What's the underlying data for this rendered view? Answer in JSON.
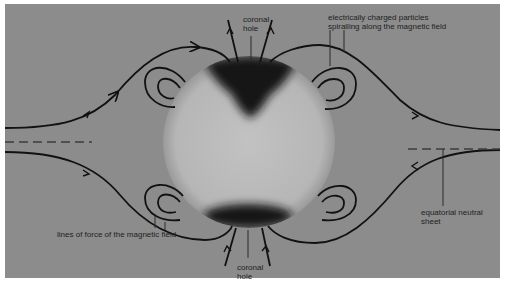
{
  "figure": {
    "background_color": "#8c8c8c",
    "sun_color": "#b9b9b9",
    "hole_color": "#141414",
    "line_color": "#111111"
  },
  "labels": {
    "coronal_hole_top": {
      "line1": "coronal",
      "line2": "hole"
    },
    "coronal_hole_bottom": {
      "line1": "coronal",
      "line2": "hole"
    },
    "charged_particles": {
      "line1": "electrically charged particles",
      "line2": "spiralling along the magnetic field"
    },
    "neutral_sheet": {
      "line1": "equatorial neutral",
      "line2": "sheet"
    },
    "lines_of_force": "lines of force of the magnetic field"
  }
}
